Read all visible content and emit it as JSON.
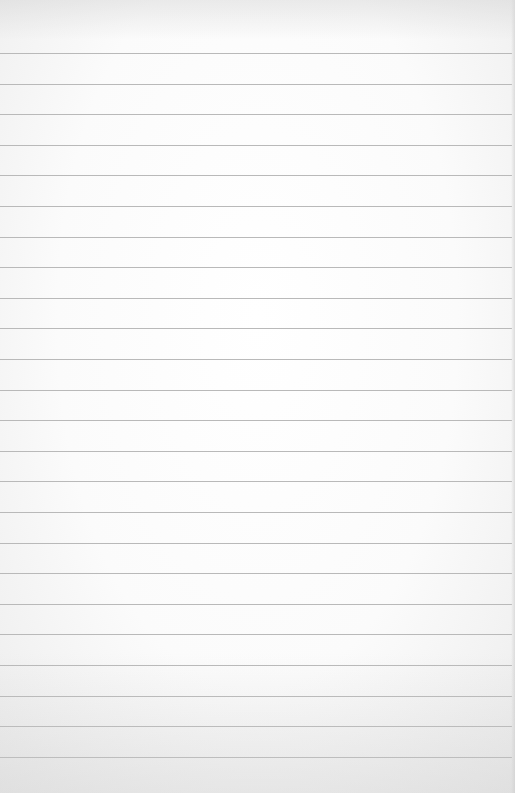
{
  "scene": {
    "subject": "blank lined paper sheet",
    "paper_color": "#fbfbfb",
    "rule_color": "#b9b9b9",
    "rule_count": 24,
    "rule_spacing_px": 30.6,
    "first_rule_y": 53,
    "text": []
  }
}
